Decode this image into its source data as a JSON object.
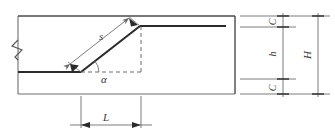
{
  "figure": {
    "kind": "engineering-cross-section-diagram",
    "background_color": "#ffffff",
    "line_color_heavy": "#2b2b2b",
    "line_color_light": "#7a7a7a",
    "label_color": "#3a3a3a"
  },
  "labels": {
    "slope_length": "s",
    "slope_angle": "α",
    "horizontal_run": "L",
    "freeboard_top": "C",
    "water_depth": "h",
    "freeboard_bottom": "C",
    "total_height": "H"
  },
  "annotations": {
    "break_symbol": "zigzag-break",
    "angle_marker": "alpha-angle-at-toe",
    "dashed_lines": [
      "horizontal-run-baseline",
      "vertical-rise"
    ]
  }
}
